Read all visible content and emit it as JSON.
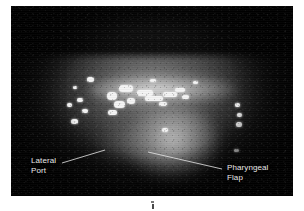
{
  "figure": {
    "kind": "endoscopic-photograph",
    "modality": "nasopharyngoscopy",
    "plate": {
      "x": 11,
      "y": 6,
      "width": 282,
      "height": 190,
      "background_color": "#0a0a0a",
      "page_background": "#ffffff"
    }
  },
  "annotations": [
    {
      "id": "lateral-port",
      "label_line_1": "Lateral",
      "label_line_2": "Port",
      "text_color": "#e8e8e8",
      "leader_line": {
        "x1": 51,
        "y1": 157,
        "x2": 94,
        "y2": 144
      }
    },
    {
      "id": "pharyngeal-flap",
      "label_line_1": "Pharyngeal",
      "label_line_2": "Flap",
      "text_color": "#e8e8e8",
      "leader_line": {
        "x1": 137,
        "y1": 146,
        "x2": 211,
        "y2": 163
      }
    }
  ],
  "highlights": [
    {
      "x": 76,
      "y": 71,
      "w": 7,
      "h": 5,
      "r": 3
    },
    {
      "x": 62,
      "y": 80,
      "w": 4,
      "h": 3,
      "r": 2
    },
    {
      "x": 66,
      "y": 92,
      "w": 6,
      "h": 4,
      "r": 2
    },
    {
      "x": 56,
      "y": 97,
      "w": 5,
      "h": 4,
      "r": 2
    },
    {
      "x": 71,
      "y": 103,
      "w": 6,
      "h": 4,
      "r": 2
    },
    {
      "x": 60,
      "y": 113,
      "w": 7,
      "h": 5,
      "r": 3
    },
    {
      "x": 96,
      "y": 86,
      "w": 10,
      "h": 8,
      "r": 5
    },
    {
      "x": 108,
      "y": 79,
      "w": 14,
      "h": 7,
      "r": 4
    },
    {
      "x": 103,
      "y": 95,
      "w": 11,
      "h": 7,
      "r": 4
    },
    {
      "x": 116,
      "y": 92,
      "w": 8,
      "h": 6,
      "r": 3
    },
    {
      "x": 97,
      "y": 104,
      "w": 9,
      "h": 5,
      "r": 3
    },
    {
      "x": 126,
      "y": 84,
      "w": 16,
      "h": 6,
      "r": 3
    },
    {
      "x": 134,
      "y": 90,
      "w": 18,
      "h": 5,
      "r": 3
    },
    {
      "x": 152,
      "y": 86,
      "w": 14,
      "h": 5,
      "r": 3
    },
    {
      "x": 164,
      "y": 82,
      "w": 10,
      "h": 4,
      "r": 2
    },
    {
      "x": 148,
      "y": 96,
      "w": 8,
      "h": 4,
      "r": 2
    },
    {
      "x": 171,
      "y": 89,
      "w": 7,
      "h": 4,
      "r": 2
    },
    {
      "x": 139,
      "y": 73,
      "w": 6,
      "h": 3,
      "r": 2
    },
    {
      "x": 182,
      "y": 75,
      "w": 5,
      "h": 3,
      "r": 2
    },
    {
      "x": 224,
      "y": 97,
      "w": 5,
      "h": 4,
      "r": 2
    },
    {
      "x": 226,
      "y": 107,
      "w": 5,
      "h": 4,
      "r": 2
    },
    {
      "x": 225,
      "y": 116,
      "w": 6,
      "h": 5,
      "r": 3
    },
    {
      "x": 223,
      "y": 143,
      "w": 5,
      "h": 3,
      "r": 2
    },
    {
      "x": 151,
      "y": 122,
      "w": 6,
      "h": 4,
      "r": 2
    }
  ]
}
